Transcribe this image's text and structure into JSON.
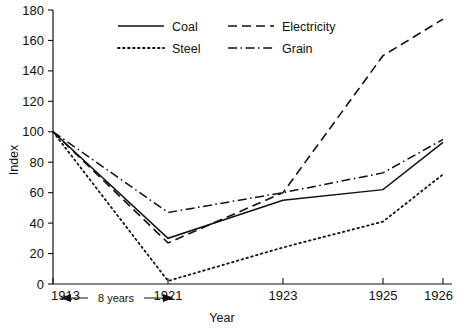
{
  "chart_data": {
    "type": "line",
    "title": "",
    "xlabel": "Year",
    "ylabel": "Index",
    "x": [
      "1913",
      "1921",
      "1923",
      "1925",
      "1926"
    ],
    "categories": [
      "1913",
      "1921",
      "1923",
      "1925",
      "1926"
    ],
    "xlim": [
      0,
      4
    ],
    "ylim": [
      0,
      180
    ],
    "ytick_values": [
      0,
      20,
      40,
      60,
      80,
      100,
      120,
      140,
      160,
      180
    ],
    "ytick_labels": [
      "0",
      "20",
      "40",
      "60",
      "80",
      "100",
      "120",
      "140",
      "160",
      "180"
    ],
    "xtick_labels": [
      "1913",
      "1921",
      "1923",
      "1925",
      "1926"
    ],
    "grid": false,
    "legend_position": "top-center",
    "series": [
      {
        "name": "Coal",
        "style": "solid",
        "values": [
          100,
          30,
          55,
          62,
          93
        ]
      },
      {
        "name": "Electricity",
        "style": "dashed",
        "values": [
          100,
          27,
          60,
          150,
          174
        ]
      },
      {
        "name": "Steel",
        "style": "dotted",
        "values": [
          100,
          2,
          24,
          41,
          72
        ]
      },
      {
        "name": "Grain",
        "style": "dash-dot",
        "values": [
          100,
          47,
          60,
          73,
          95
        ]
      }
    ],
    "annotations": [
      {
        "text": "8 years",
        "from": "1913",
        "to": "1921",
        "arrow": "double"
      }
    ]
  },
  "legend": {
    "entries": [
      {
        "label": "Coal"
      },
      {
        "label": "Electricity"
      },
      {
        "label": "Steel"
      },
      {
        "label": "Grain"
      }
    ]
  },
  "axes": {
    "y_title": "Index",
    "x_title": "Year"
  }
}
